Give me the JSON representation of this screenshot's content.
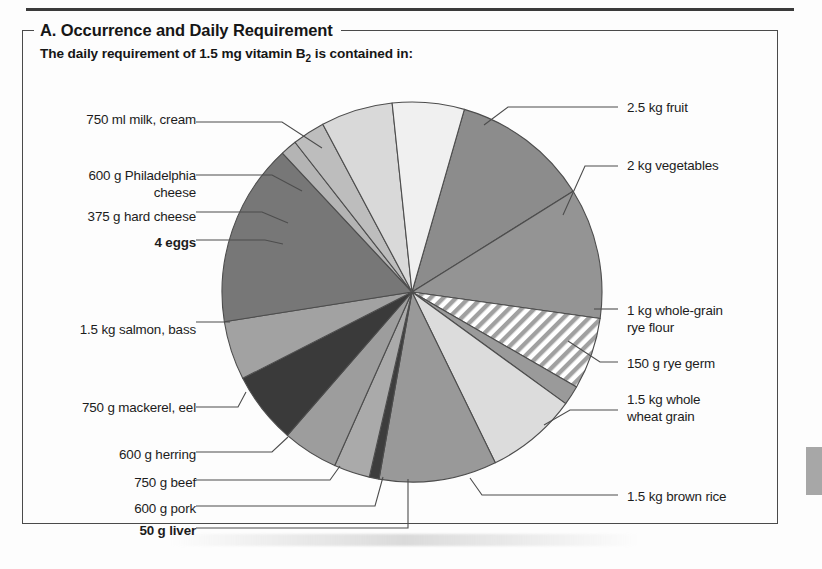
{
  "panel": {
    "title": "A. Occurrence and Daily Requirement",
    "subtitle_prefix": "The daily requirement of 1.5 mg vitamin B",
    "subtitle_sub": "2",
    "subtitle_suffix": " is contained in:"
  },
  "chart_data": {
    "type": "pie",
    "title": "A. Occurrence and Daily Requirement",
    "subtitle": "The daily requirement of 1.5 mg vitamin B2 is contained in:",
    "legend_position": "callout-labels",
    "grid": false,
    "units": "amount of food providing 1.5 mg riboflavin",
    "note": "Each slice is one food item; slice angle is schematic, all items supply the same 1.5 mg vitamin B2.",
    "categories": [
      "2.5 kg fruit",
      "2 kg vegetables",
      "1 kg whole-grain rye flour",
      "150 g rye germ",
      "1.5 kg whole wheat grain",
      "1.5 kg brown rice",
      "50 g liver",
      "600 g pork",
      "750 g beef",
      "600 g herring",
      "750 g mackerel, eel",
      "1.5 kg salmon, bass",
      "4 eggs",
      "375 g hard cheese",
      "600 g Philadelphia cheese",
      "750 ml milk, cream"
    ],
    "values": [
      42,
      40,
      22,
      6,
      28,
      36,
      3,
      11,
      17,
      22,
      18,
      56,
      5,
      10,
      22,
      22
    ],
    "start_angle_deg": -74,
    "slices": [
      {
        "label": "2.5 kg fruit",
        "start": -74,
        "end": -32,
        "fill": "#8c8c8c",
        "hatch": false,
        "bold": false,
        "side": "right",
        "label_x": 627,
        "label_y": 100,
        "leader": "M 484,125 L 508,107 L 618,107"
      },
      {
        "label": "2 kg vegetables",
        "start": -32,
        "end": 8,
        "fill": "#949494",
        "hatch": false,
        "bold": false,
        "side": "right",
        "label_x": 627,
        "label_y": 158,
        "leader": "M 563,215 L 585,166 L 618,166"
      },
      {
        "label": "1 kg whole-grain\nrye flour",
        "start": 8,
        "end": 30,
        "fill": "#ffffff",
        "hatch": true,
        "bold": false,
        "side": "right",
        "label_x": 627,
        "label_y": 303,
        "leader": "M 594,309 L 618,309"
      },
      {
        "label": "150 g rye germ",
        "start": 30,
        "end": 36,
        "fill": "#9a9a9a",
        "hatch": false,
        "bold": false,
        "side": "right",
        "label_x": 627,
        "label_y": 356,
        "leader": "M 568,341 L 600,362 L 618,362"
      },
      {
        "label": "1.5 kg whole\nwheat grain",
        "start": 36,
        "end": 64,
        "fill": "#dcdcdc",
        "hatch": false,
        "bold": false,
        "side": "right",
        "label_x": 627,
        "label_y": 392,
        "leader": "M 544,425 L 570,410 L 618,410"
      },
      {
        "label": "1.5 kg brown rice",
        "start": 64,
        "end": 100,
        "fill": "#999999",
        "hatch": false,
        "bold": false,
        "side": "right",
        "label_x": 627,
        "label_y": 489,
        "leader": "M 470,478 L 482,495 L 618,495"
      },
      {
        "label": "50 g liver",
        "start": 100,
        "end": 103,
        "fill": "#3d3d3d",
        "hatch": false,
        "bold": true,
        "side": "left",
        "label_x": 62,
        "label_y": 523,
        "leader": "M 408,479 L 408,528 L 196,528"
      },
      {
        "label": "600 g pork",
        "start": 103,
        "end": 114,
        "fill": "#aaaaaa",
        "hatch": false,
        "bold": false,
        "side": "left",
        "label_x": 62,
        "label_y": 501,
        "leader": "M 383,477 L 375,506 L 196,506"
      },
      {
        "label": "750 g beef",
        "start": 114,
        "end": 131,
        "fill": "#9d9d9d",
        "hatch": false,
        "bold": false,
        "side": "left",
        "label_x": 62,
        "label_y": 475,
        "leader": "M 340,466 L 330,480 L 196,480"
      },
      {
        "label": "600 g herring",
        "start": 131,
        "end": 153,
        "fill": "#3a3a3a",
        "hatch": false,
        "bold": false,
        "side": "left",
        "label_x": 62,
        "label_y": 447,
        "leader": "M 288,437 L 272,452 L 196,452"
      },
      {
        "label": "750 g mackerel, eel",
        "start": 153,
        "end": 171,
        "fill": "#a2a2a2",
        "hatch": false,
        "bold": false,
        "side": "left",
        "label_x": 62,
        "label_y": 400,
        "leader": "M 246,392 L 238,407 L 196,407"
      },
      {
        "label": "1.5 kg salmon, bass",
        "start": 171,
        "end": 227,
        "fill": "#777777",
        "hatch": false,
        "bold": false,
        "side": "left",
        "label_x": 62,
        "label_y": 322,
        "leader": "M 230,322 L 196,322"
      },
      {
        "label": "4 eggs",
        "start": 227,
        "end": 232,
        "fill": "#b4b4b4",
        "hatch": false,
        "bold": true,
        "side": "left",
        "label_x": 62,
        "label_y": 235,
        "leader": "M 283,244 L 265,240 L 196,240"
      },
      {
        "label": "375 g hard cheese",
        "start": 232,
        "end": 242,
        "fill": "#bdbdbd",
        "hatch": false,
        "bold": false,
        "side": "left",
        "label_x": 62,
        "label_y": 209,
        "leader": "M 288,223 L 262,212 L 196,212"
      },
      {
        "label": "600 g Philadelphia\ncheese",
        "start": 242,
        "end": 264,
        "fill": "#d9d9d9",
        "hatch": false,
        "bold": false,
        "side": "left",
        "label_x": 62,
        "label_y": 168,
        "leader": "M 302,191 L 272,175 L 196,175"
      },
      {
        "label": "750 ml milk, cream",
        "start": 264,
        "end": 286,
        "fill": "#f0f0f0",
        "hatch": false,
        "bold": false,
        "side": "left",
        "label_x": 62,
        "label_y": 112,
        "leader": "M 322,148 L 282,122 L 196,122"
      }
    ],
    "geometry": {
      "cx": 412,
      "cy": 292,
      "r": 190
    }
  },
  "colors": {
    "frame_border": "#4a4a4a",
    "top_rule": "#3a3a3a",
    "text": "#1a1a1a",
    "page_tab": "#a7a7a7",
    "slice_stroke": "#4d4d4d"
  },
  "labels": {
    "right": [
      {
        "text": "2.5 kg fruit",
        "bold": false
      },
      {
        "text": "2 kg vegetables",
        "bold": false
      },
      {
        "text": "1 kg whole-grain\nrye flour",
        "bold": false
      },
      {
        "text": "150 g rye germ",
        "bold": false
      },
      {
        "text": "1.5 kg whole\nwheat grain",
        "bold": false
      },
      {
        "text": "1.5 kg brown rice",
        "bold": false
      }
    ],
    "left": [
      {
        "text": "750 ml milk, cream",
        "bold": false
      },
      {
        "text": "600 g Philadelphia\ncheese",
        "bold": false
      },
      {
        "text": "375 g hard cheese",
        "bold": false
      },
      {
        "text": "4 eggs",
        "bold": true
      },
      {
        "text": "1.5 kg salmon, bass",
        "bold": false
      },
      {
        "text": "750 g mackerel, eel",
        "bold": false
      },
      {
        "text": "600 g herring",
        "bold": false
      },
      {
        "text": "750 g beef",
        "bold": false
      },
      {
        "text": "600 g pork",
        "bold": false
      },
      {
        "text": "50 g liver",
        "bold": true
      }
    ]
  }
}
